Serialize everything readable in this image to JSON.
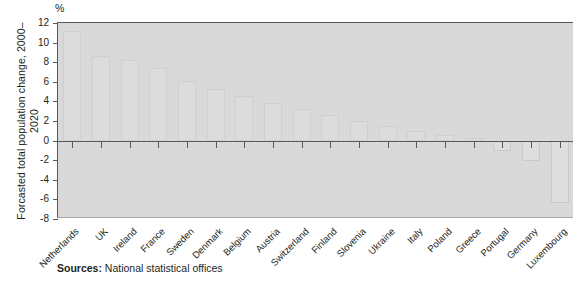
{
  "unit": "%",
  "ylabel": "Forcasted total population\nchange, 2000–2020",
  "source_prefix": "Sources:",
  "source_text": "National statistical offices",
  "colors": {
    "plot_background": "#d9d9d9",
    "bar_fill": "#dcdcdc",
    "axis": "#58595b",
    "page_background": "#ffffff",
    "text": "#231f20"
  },
  "chart_data": {
    "type": "bar",
    "title": "",
    "subtitle": "",
    "xlabel": "",
    "ylabel": "Forcasted total population change, 2000–2020",
    "unit": "%",
    "ylim": [
      -8,
      12
    ],
    "yticks": [
      12,
      10,
      8,
      6,
      4,
      2,
      0,
      -2,
      -4,
      -6,
      -8
    ],
    "grid": false,
    "legend": null,
    "categories": [
      "Netherlands",
      "UK",
      "Ireland",
      "France",
      "Sweden",
      "Denmark",
      "Belgium",
      "Austria",
      "Switzerland",
      "Finland",
      "Slovenia",
      "Ukraine",
      "Italy",
      "Poland",
      "Greece",
      "Portugal",
      "Germany",
      "Luxembourg"
    ],
    "values": [
      11.2,
      8.6,
      8.2,
      7.4,
      6.1,
      5.3,
      4.6,
      3.8,
      3.2,
      2.6,
      2.0,
      1.5,
      1.0,
      0.6,
      0.3,
      -1.1,
      -2.1,
      -6.4
    ]
  }
}
